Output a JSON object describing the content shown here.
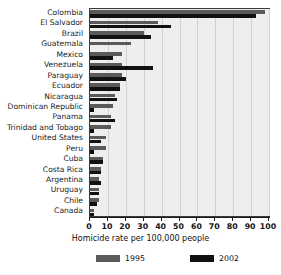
{
  "chart_data": {
    "type": "bar",
    "orientation": "horizontal",
    "title": "",
    "xlabel": "Homicide rate per 100,000 people",
    "ylabel": "",
    "xlim": [
      0,
      100
    ],
    "xticks": [
      0,
      10,
      20,
      30,
      40,
      50,
      60,
      70,
      80,
      90,
      100
    ],
    "grid": true,
    "legend_position": "bottom",
    "categories": [
      "Colombia",
      "El Salvador",
      "Brazil",
      "Guatemala",
      "Mexico",
      "Venezuela",
      "Paraguay",
      "Ecuador",
      "Nicaragua",
      "Dominican Republic",
      "Panama",
      "Trinidad and Tobago",
      "United States",
      "Peru",
      "Cuba",
      "Costa Rica",
      "Argentina",
      "Uruguay",
      "Chile",
      "Canada"
    ],
    "series": [
      {
        "name": "1995",
        "color": "#5a5a5a",
        "values": [
          98,
          38,
          30,
          23,
          18,
          18,
          18,
          17,
          14,
          13,
          12,
          12,
          9,
          9,
          7,
          6,
          5,
          5,
          5,
          2
        ]
      },
      {
        "name": "2002",
        "color": "#111111",
        "values": [
          93,
          45,
          34,
          0,
          13,
          35,
          20,
          17,
          15,
          2,
          14,
          2,
          6,
          2,
          7,
          6,
          6,
          5,
          4,
          2
        ]
      }
    ]
  },
  "legend": {
    "items": [
      {
        "label": "1995"
      },
      {
        "label": "2002"
      }
    ]
  }
}
